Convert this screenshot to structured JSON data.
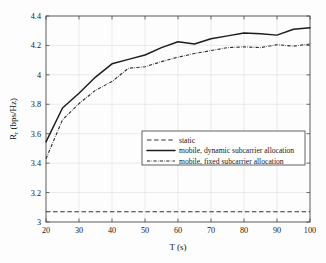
{
  "chart_data": {
    "type": "line",
    "title": "",
    "xlabel": "T (s)",
    "ylabel": "R_r (bps/Hz)",
    "ylabel_main": "R",
    "ylabel_sub": "r",
    "ylabel_rest": " (bps/Hz)",
    "xlim": [
      20,
      100
    ],
    "ylim": [
      3,
      4.4
    ],
    "xticks": [
      20,
      30,
      40,
      50,
      60,
      70,
      80,
      90,
      100
    ],
    "xtick_labels": [
      "20",
      "30",
      "40",
      "50",
      "60",
      "70",
      "80",
      "90",
      "100"
    ],
    "yticks": [
      3,
      3.2,
      3.4,
      3.6,
      3.8,
      4,
      4.2,
      4.4
    ],
    "ytick_labels": [
      "3",
      "3.2",
      "3.4",
      "3.6",
      "3.8",
      "4",
      "4.2",
      "4.4"
    ],
    "grid": true,
    "legend_position": "lower-right",
    "x": [
      20,
      25,
      30,
      35,
      40,
      45,
      50,
      55,
      60,
      65,
      70,
      75,
      80,
      85,
      90,
      95,
      100
    ],
    "series": [
      {
        "name": "static",
        "style": "dashed",
        "color": "#333333",
        "values": [
          3.07,
          3.07,
          3.07,
          3.07,
          3.07,
          3.07,
          3.07,
          3.07,
          3.07,
          3.07,
          3.07,
          3.07,
          3.07,
          3.07,
          3.07,
          3.07,
          3.07
        ]
      },
      {
        "name": "mobile, dynamic subcarrier allocation",
        "style": "solid",
        "color": "#1c1c1c",
        "values": [
          3.545,
          3.775,
          3.875,
          3.985,
          4.075,
          4.105,
          4.135,
          4.185,
          4.225,
          4.21,
          4.245,
          4.265,
          4.285,
          4.28,
          4.27,
          4.31,
          4.32
        ]
      },
      {
        "name": "mobile, fixed subcarrier allocation",
        "style": "dashdot",
        "color": "#2a2a2a",
        "values": [
          3.43,
          3.695,
          3.805,
          3.895,
          3.955,
          4.045,
          4.055,
          4.09,
          4.12,
          4.145,
          4.165,
          4.185,
          4.19,
          4.185,
          4.205,
          4.195,
          4.21
        ]
      }
    ]
  },
  "legend": {
    "items": [
      {
        "label": "static",
        "style": "dashed"
      },
      {
        "label": "mobile, dynamic subcarrier allocation",
        "style": "solid"
      },
      {
        "label": "mobile, fixed subcarrier allocation",
        "style": "dashdot"
      }
    ]
  }
}
